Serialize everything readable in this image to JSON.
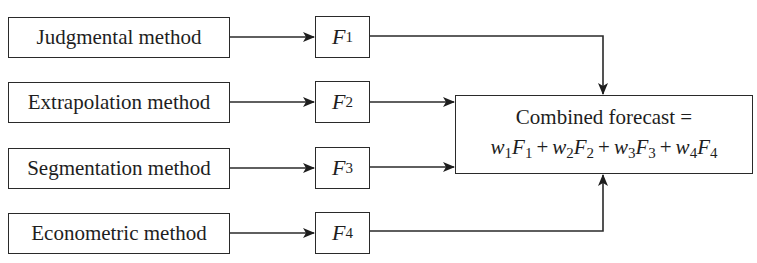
{
  "diagram": {
    "methods": [
      {
        "label": "Judgmental method",
        "forecast_symbol": "F",
        "forecast_index": "1"
      },
      {
        "label": "Extrapolation method",
        "forecast_symbol": "F",
        "forecast_index": "2"
      },
      {
        "label": "Segmentation method",
        "forecast_symbol": "F",
        "forecast_index": "3"
      },
      {
        "label": "Econometric method",
        "forecast_symbol": "F",
        "forecast_index": "4"
      }
    ],
    "combined": {
      "title": "Combined forecast =",
      "terms": [
        {
          "w": "w",
          "wi": "1",
          "f": "F",
          "fi": "1"
        },
        {
          "w": "w",
          "wi": "2",
          "f": "F",
          "fi": "2"
        },
        {
          "w": "w",
          "wi": "3",
          "f": "F",
          "fi": "3"
        },
        {
          "w": "w",
          "wi": "4",
          "f": "F",
          "fi": "4"
        }
      ],
      "operator": "+"
    },
    "colors": {
      "line": "#2a2a2a",
      "background": "#ffffff"
    }
  }
}
